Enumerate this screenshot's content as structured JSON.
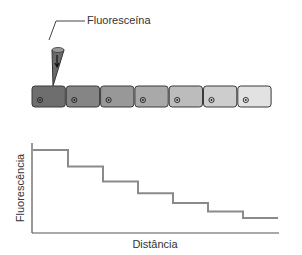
{
  "figure": {
    "pipette_label": "Fluoresceína",
    "cells": [
      {
        "fill": "#6e6e6e"
      },
      {
        "fill": "#858585"
      },
      {
        "fill": "#989898"
      },
      {
        "fill": "#a9a9a9"
      },
      {
        "fill": "#bcbcbc"
      },
      {
        "fill": "#cdcdcd"
      },
      {
        "fill": "#e2e2e2"
      }
    ]
  },
  "chart_data": {
    "type": "line",
    "title": "",
    "xlabel": "Distância",
    "ylabel": "Fluorescência",
    "step": true,
    "x": [
      1,
      2,
      3,
      4,
      5,
      6,
      7
    ],
    "series": [
      {
        "name": "Fluorescência",
        "values": [
          100,
          80,
          62,
          48,
          36,
          26,
          18
        ]
      }
    ],
    "grid": false,
    "ticks": false
  }
}
